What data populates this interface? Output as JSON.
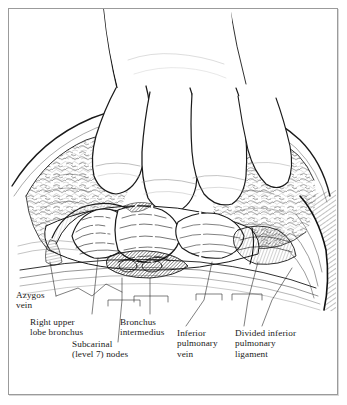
{
  "figure": {
    "kind": "surgical-anatomical-illustration",
    "technique": "pen-and-ink line drawing",
    "border_color": "#9b9b9b",
    "ink_color": "#1a1a1a",
    "background_color": "#ffffff"
  },
  "labels": [
    {
      "id": "azygos-vein",
      "text": "Azygos\nvein",
      "lines": [
        "Azygos",
        "vein"
      ]
    },
    {
      "id": "right-upper-lobe-bronchus",
      "text": "Right upper\nlobe bronchus",
      "lines": [
        "Right upper",
        "lobe bronchus"
      ]
    },
    {
      "id": "subcarinal-nodes",
      "text": "Subcarinal\n(level 7) nodes",
      "lines": [
        "Subcarinal",
        "(level 7) nodes"
      ]
    },
    {
      "id": "bronchus-intermedius",
      "text": "Bronchus\nintermedius",
      "lines": [
        "Bronchus",
        "intermedius"
      ]
    },
    {
      "id": "inferior-pulmonary-vein",
      "text": "Inferior\npulmonary\nvein",
      "lines": [
        "Inferior",
        "pulmonary",
        "vein"
      ]
    },
    {
      "id": "divided-inferior-pulmonary-ligament",
      "text": "Divided inferior\npulmonary\nligament",
      "lines": [
        "Divided inferior",
        "pulmonary",
        "ligament"
      ]
    }
  ],
  "label_text": {
    "azygos_vein": "Azygos\nvein",
    "right_upper_lobe_bronchus": "Right upper\nlobe bronchus",
    "subcarinal_nodes": "Subcarinal\n(level 7) nodes",
    "bronchus_intermedius": "Bronchus\nintermedius",
    "inferior_pulmonary_vein": "Inferior\npulmonary\nvein",
    "divided_inferior_pulmonary_ligament": "Divided inferior\npulmonary\nligament"
  }
}
